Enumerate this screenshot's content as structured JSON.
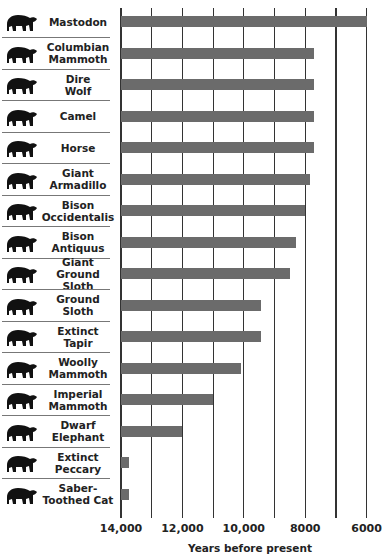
{
  "chart_data": {
    "type": "bar",
    "orientation": "horizontal",
    "title": "",
    "xlabel": "Years before present",
    "ylabel": "",
    "xlim": [
      14000,
      6000
    ],
    "x_reversed": true,
    "xticks": [
      "14,000",
      "12,000",
      "10,000",
      "8000",
      "6000"
    ],
    "grid": "vertical every 1000 years",
    "categories": [
      "Mastodon",
      "Columbian Mammoth",
      "Dire Wolf",
      "Camel",
      "Horse",
      "Giant Armadillo",
      "Bison Occidentalis",
      "Bison Antiquus",
      "Giant Ground Sloth",
      "Ground Sloth",
      "Extinct Tapir",
      "Woolly Mammoth",
      "Imperial Mammoth",
      "Dwarf Elephant",
      "Extinct Peccary",
      "Saber-Toothed Cat"
    ],
    "values": [
      6000,
      7700,
      7700,
      7700,
      7700,
      7850,
      8000,
      8300,
      8500,
      9450,
      9450,
      10100,
      11000,
      12000,
      13750,
      13750
    ],
    "bar_color": "#6b6b6b"
  },
  "rows": [
    {
      "label": "Mastodon",
      "icon": "mastodon-icon"
    },
    {
      "label": "Columbian\nMammoth",
      "icon": "mammoth-icon"
    },
    {
      "label": "Dire\nWolf",
      "icon": "wolf-icon"
    },
    {
      "label": "Camel",
      "icon": "camel-icon"
    },
    {
      "label": "Horse",
      "icon": "horse-icon"
    },
    {
      "label": "Giant\nArmadillo",
      "icon": "armadillo-icon"
    },
    {
      "label": "Bison\nOccidentalis",
      "icon": "bison-icon"
    },
    {
      "label": "Bison\nAntiquus",
      "icon": "bison-icon"
    },
    {
      "label": "Giant\nGround Sloth",
      "icon": "giant-sloth-icon"
    },
    {
      "label": "Ground\nSloth",
      "icon": "sloth-icon"
    },
    {
      "label": "Extinct\nTapir",
      "icon": "tapir-icon"
    },
    {
      "label": "Woolly\nMammoth",
      "icon": "mammoth-icon"
    },
    {
      "label": "Imperial\nMammoth",
      "icon": "mammoth-icon"
    },
    {
      "label": "Dwarf\nElephant",
      "icon": "elephant-icon"
    },
    {
      "label": "Extinct\nPeccary",
      "icon": "peccary-icon"
    },
    {
      "label": "Saber-\nToothed Cat",
      "icon": "sabertooth-icon"
    }
  ],
  "axis": {
    "ticks": [
      {
        "label": "14,000",
        "value": 14000
      },
      {
        "label": "12,000",
        "value": 12000
      },
      {
        "label": "10,000",
        "value": 10000
      },
      {
        "label": "8000",
        "value": 8000
      },
      {
        "label": "6000",
        "value": 6000
      }
    ],
    "xlabel": "Years before present"
  }
}
